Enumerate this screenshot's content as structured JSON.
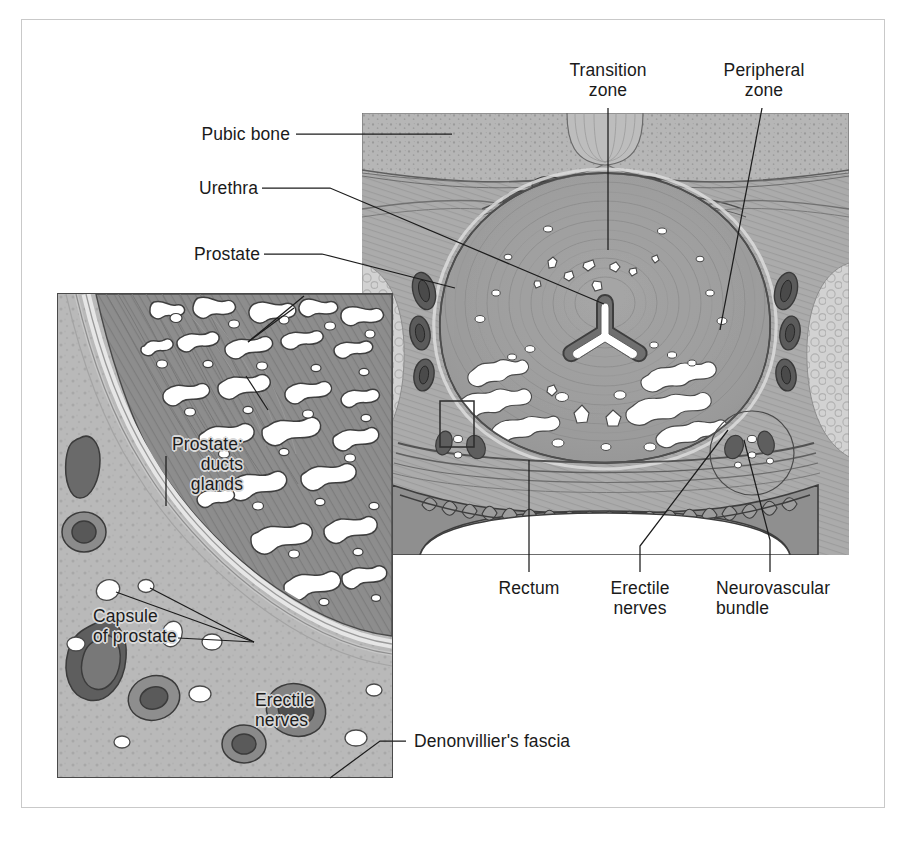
{
  "figure": {
    "type": "anatomical-illustration",
    "background_color": "#ffffff",
    "frame_color": "#c9c9c9"
  },
  "labels": {
    "pubic_bone": "Pubic bone",
    "urethra": "Urethra",
    "prostate": "Prostate",
    "transition_zone": "Transition\nzone",
    "peripheral_zone": "Peripheral\nzone",
    "rectum": "Rectum",
    "erectile_nerves_main": "Erectile\nnerves",
    "neurovascular_bundle": "Neurovascular\nbundle",
    "denonvilliers_fascia": "Denonvillier's fascia",
    "prostate_ducts_glands": "Prostate:\nducts\nglands",
    "capsule_of_prostate": "Capsule\nof prostate",
    "erectile_nerves_inset": "Erectile\nnerves"
  },
  "palette": {
    "ink": "#1c1c1c",
    "bone_fill": "#b3b3b3",
    "muscle_fill": "#a8a8a8",
    "prostate_fill": "#a0a0a0",
    "prostate_dark": "#8a8a8a",
    "gland_white": "#ffffff",
    "vessel_dark": "#5a5a5a",
    "vessel_mid": "#777777",
    "fat_light": "#cccccc",
    "rectum_fill": "#8f8f8f",
    "inset_tissue_dark": "#8d8d8d",
    "inset_stroma": "#b8b8b8",
    "capsule_light": "#d5d5d5",
    "halo": "#d8d8d8"
  }
}
